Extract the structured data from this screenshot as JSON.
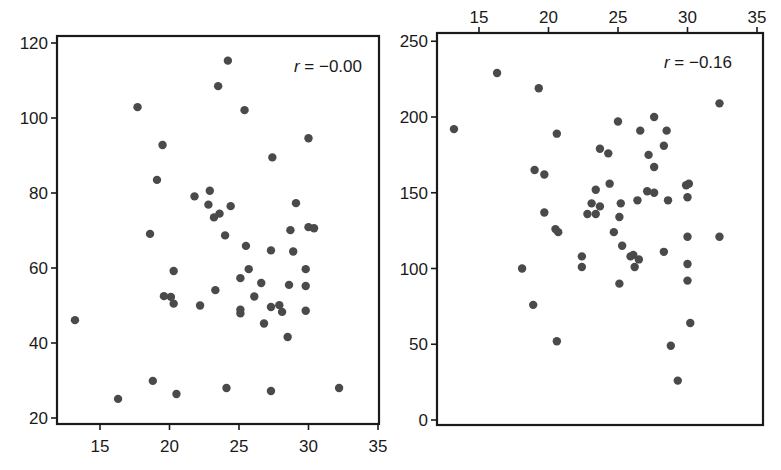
{
  "chart_data": [
    {
      "type": "scatter",
      "panel": "left",
      "title": "",
      "annotation": "r = −0.00",
      "r_value": -0.0,
      "xlabel": "",
      "ylabel": "",
      "xlim": [
        12,
        35.5
      ],
      "ylim": [
        18,
        122
      ],
      "xticks": [
        15,
        20,
        25,
        30,
        35
      ],
      "yticks": [
        20,
        40,
        60,
        80,
        100,
        120
      ],
      "x_axis_position": "bottom",
      "grid": false,
      "marker_color": "#4a4a4a",
      "points": [
        [
          24.2,
          115.3
        ],
        [
          23.5,
          108.5
        ],
        [
          17.7,
          102.9
        ],
        [
          25.4,
          102.1
        ],
        [
          30.0,
          94.6
        ],
        [
          19.5,
          92.8
        ],
        [
          27.4,
          89.5
        ],
        [
          19.1,
          83.5
        ],
        [
          22.9,
          80.6
        ],
        [
          21.8,
          79.1
        ],
        [
          22.8,
          76.9
        ],
        [
          24.4,
          76.5
        ],
        [
          29.1,
          77.3
        ],
        [
          23.2,
          73.5
        ],
        [
          23.6,
          74.5
        ],
        [
          24.0,
          68.7
        ],
        [
          18.6,
          69.1
        ],
        [
          30.0,
          70.9
        ],
        [
          30.4,
          70.6
        ],
        [
          28.7,
          70.1
        ],
        [
          27.3,
          64.7
        ],
        [
          25.5,
          65.9
        ],
        [
          28.9,
          64.4
        ],
        [
          20.3,
          59.2
        ],
        [
          25.7,
          59.7
        ],
        [
          29.8,
          59.7
        ],
        [
          25.1,
          57.3
        ],
        [
          26.6,
          56.0
        ],
        [
          28.6,
          55.5
        ],
        [
          29.8,
          55.2
        ],
        [
          23.3,
          54.1
        ],
        [
          19.6,
          52.5
        ],
        [
          20.1,
          52.3
        ],
        [
          20.3,
          50.5
        ],
        [
          26.1,
          52.4
        ],
        [
          22.2,
          50.0
        ],
        [
          27.3,
          49.6
        ],
        [
          27.9,
          50.1
        ],
        [
          28.1,
          48.3
        ],
        [
          25.1,
          48.9
        ],
        [
          25.1,
          47.9
        ],
        [
          29.8,
          48.6
        ],
        [
          13.2,
          46.1
        ],
        [
          26.8,
          45.2
        ],
        [
          28.5,
          41.6
        ],
        [
          18.8,
          29.9
        ],
        [
          16.3,
          25.1
        ],
        [
          20.5,
          26.4
        ],
        [
          24.1,
          28.0
        ],
        [
          27.3,
          27.2
        ],
        [
          32.2,
          28.0
        ]
      ]
    },
    {
      "type": "scatter",
      "panel": "right",
      "title": "",
      "annotation": "r = −0.16",
      "r_value": -0.16,
      "xlabel": "",
      "ylabel": "",
      "xlim": [
        12,
        35.5
      ],
      "ylim": [
        -5,
        255
      ],
      "xticks": [
        15,
        20,
        25,
        30,
        35
      ],
      "yticks": [
        0,
        50,
        100,
        150,
        200,
        250
      ],
      "x_axis_position": "top",
      "grid": false,
      "marker_color": "#4a4a4a",
      "points": [
        [
          16.3,
          229
        ],
        [
          19.3,
          219
        ],
        [
          13.2,
          192
        ],
        [
          20.6,
          189
        ],
        [
          32.3,
          209
        ],
        [
          25.0,
          197
        ],
        [
          27.6,
          200
        ],
        [
          26.6,
          191
        ],
        [
          28.5,
          191
        ],
        [
          23.7,
          179
        ],
        [
          24.3,
          176
        ],
        [
          28.3,
          181
        ],
        [
          27.2,
          175
        ],
        [
          27.6,
          167
        ],
        [
          19.0,
          165
        ],
        [
          19.7,
          162
        ],
        [
          24.4,
          156
        ],
        [
          30.1,
          156
        ],
        [
          23.4,
          152
        ],
        [
          27.1,
          151
        ],
        [
          27.6,
          150
        ],
        [
          30.0,
          147
        ],
        [
          26.4,
          145
        ],
        [
          28.6,
          145
        ],
        [
          23.1,
          143
        ],
        [
          23.7,
          141
        ],
        [
          25.2,
          143
        ],
        [
          22.8,
          136
        ],
        [
          23.4,
          136
        ],
        [
          25.1,
          134
        ],
        [
          19.7,
          137
        ],
        [
          20.5,
          126
        ],
        [
          20.7,
          124
        ],
        [
          24.7,
          124
        ],
        [
          25.3,
          115
        ],
        [
          32.3,
          121
        ],
        [
          29.9,
          155
        ],
        [
          26.1,
          109
        ],
        [
          26.5,
          106
        ],
        [
          25.9,
          108
        ],
        [
          28.3,
          111
        ],
        [
          30.0,
          121
        ],
        [
          22.4,
          108
        ],
        [
          22.4,
          101
        ],
        [
          18.1,
          100
        ],
        [
          26.2,
          101
        ],
        [
          30.0,
          103
        ],
        [
          30.0,
          92
        ],
        [
          25.1,
          90
        ],
        [
          18.9,
          76
        ],
        [
          30.2,
          64
        ],
        [
          20.6,
          52
        ],
        [
          28.8,
          49
        ],
        [
          29.3,
          26
        ]
      ]
    }
  ],
  "left_panel": {
    "annotation_r": "r",
    "annotation_rest": " = −0.00",
    "x_tick_labels": [
      "15",
      "20",
      "25",
      "30",
      "35"
    ],
    "y_tick_labels": [
      "20",
      "40",
      "60",
      "80",
      "100",
      "120"
    ]
  },
  "right_panel": {
    "annotation_r": "r",
    "annotation_rest": " = −0.16",
    "x_tick_labels": [
      "15",
      "20",
      "25",
      "30",
      "35"
    ],
    "y_tick_labels": [
      "0",
      "50",
      "100",
      "150",
      "200",
      "250"
    ]
  },
  "caption": "Figure 2.3   Scatterplots with linear correlation coefficients r = 0.00"
}
